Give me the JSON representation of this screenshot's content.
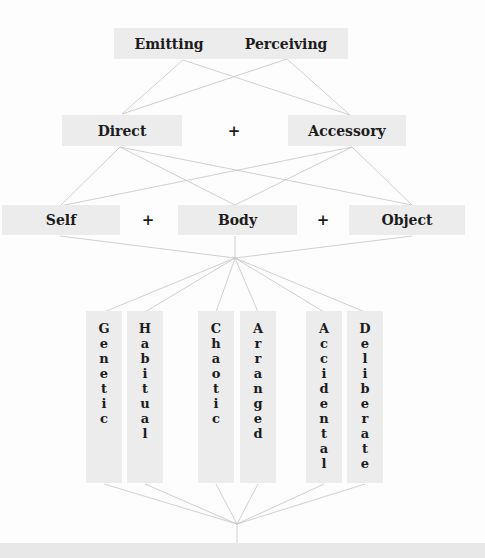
{
  "level1": {
    "left": "Emitting",
    "right": "Perceiving"
  },
  "level2": {
    "left": "Direct",
    "operator": "+",
    "right": "Accessory"
  },
  "level3": {
    "left": "Self",
    "operator1": "+",
    "middle": "Body",
    "operator2": "+",
    "right": "Object"
  },
  "level4": {
    "columns": [
      "Genetic",
      "Habitual",
      "Chaotic",
      "Arranged",
      "Accidental",
      "Deliberate"
    ]
  },
  "colors": {
    "box_fill": "#ececec",
    "line": "#c4c4c4",
    "text": "#1c1c1c"
  }
}
